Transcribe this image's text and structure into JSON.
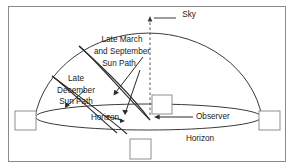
{
  "figure": {
    "background_color": "#ffffff",
    "line_color": "#2b2b2b",
    "border_color": "#8a8a8a",
    "labels": {
      "sky": "Sky",
      "march_september_line1": "Late March",
      "march_september_line2": "and September",
      "march_september_line3": "Sun Path",
      "december_line1": "Late",
      "december_line2": "December",
      "december_line3": "Sun Path",
      "horizon_inner": "Horizon",
      "horizon_outer": "Horizon",
      "observer": "Observer"
    },
    "elements": {
      "dome": "sky-dome-arc",
      "horizon_ellipse": "horizon-ellipse",
      "zenith_line": "zenith-dashed-line",
      "sun_path_equinox": "equinox-sun-path-arc",
      "sun_path_winter": "winter-sun-path-arc",
      "placeholder_boxes": 4
    }
  }
}
